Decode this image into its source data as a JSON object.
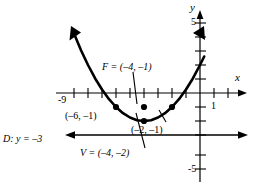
{
  "figure": {
    "type": "parabola-graph",
    "axes": {
      "x_axis_label": "x",
      "y_axis_label": "y",
      "x_tick_label": "1",
      "y_tick_labels": [
        "5",
        "-5"
      ],
      "x_left_tick_label": "-9"
    },
    "labels": {
      "focus": "F = (–4, –1)",
      "vertex": "V = (–4, –2)",
      "point_left": "(–6, –1)",
      "point_right": "(–2, –1)",
      "directrix": "D: y = –3"
    }
  },
  "chart_data": {
    "type": "line",
    "title": "",
    "xlabel": "x",
    "ylabel": "y",
    "xlim": [
      -10,
      2
    ],
    "ylim": [
      -6,
      6
    ],
    "grid": false,
    "legend": "none",
    "curves": [
      {
        "name": "parabola",
        "equation": "(x + 4)^2 = 4(y + 2)",
        "vertex": [
          -4,
          -2
        ],
        "focus": [
          -4,
          -1
        ],
        "directrix_y": -3,
        "x": [
          -9.0,
          -8.5,
          -8.0,
          -7.5,
          -7.0,
          -6.5,
          -6.0,
          -5.5,
          -5.0,
          -4.5,
          -4.0,
          -3.5,
          -3.0,
          -2.5,
          -2.0,
          -1.5,
          -1.0,
          -0.5,
          0.0,
          0.3
        ],
        "y": [
          4.25,
          3.06,
          2.0,
          1.06,
          0.25,
          -0.44,
          -1.0,
          -1.44,
          -1.75,
          -1.94,
          -2.0,
          -1.94,
          -1.75,
          -1.44,
          -1.0,
          -0.44,
          0.25,
          1.06,
          2.0,
          2.61
        ]
      }
    ],
    "points": [
      {
        "label": "F = (–4, –1)",
        "x": -4,
        "y": -1,
        "role": "focus"
      },
      {
        "label": "V = (–4, –2)",
        "x": -4,
        "y": -2,
        "role": "vertex"
      },
      {
        "label": "(–6, –1)",
        "x": -6,
        "y": -1,
        "role": "latus-rectum-endpoint"
      },
      {
        "label": "(–2, –1)",
        "x": -2,
        "y": -1,
        "role": "latus-rectum-endpoint"
      }
    ],
    "lines": [
      {
        "label": "D: y = –3",
        "type": "horizontal",
        "y": -3,
        "role": "directrix"
      }
    ],
    "xticks": [
      -9,
      -8,
      -7,
      -6,
      -5,
      -4,
      -3,
      -2,
      -1,
      1
    ],
    "yticks": [
      5,
      4,
      3,
      2,
      1,
      -1,
      -2,
      -3,
      -4,
      -5
    ],
    "xtick_labels_shown": [
      -9,
      1
    ],
    "ytick_labels_shown": [
      5,
      -5
    ]
  },
  "colors": {
    "ink": "#000000",
    "background": "#ffffff"
  }
}
